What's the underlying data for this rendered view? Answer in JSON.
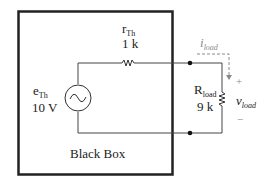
{
  "diagram": {
    "box_label": "Black Box",
    "source": {
      "name": "e",
      "name_sub": "Th",
      "value": "10 V",
      "symbol": "ac-source"
    },
    "series_resistor": {
      "name": "r",
      "name_sub": "Th",
      "value": "1 k"
    },
    "load_resistor": {
      "name": "R",
      "name_sub": "load",
      "value": "9 k"
    },
    "current": {
      "name": "i",
      "name_sub": "load"
    },
    "voltage": {
      "name": "v",
      "name_sub": "load",
      "plus": "+",
      "minus": "−"
    },
    "colors": {
      "wire": "#333333",
      "box": "#222222",
      "annotation": "#8a8a8a"
    }
  }
}
